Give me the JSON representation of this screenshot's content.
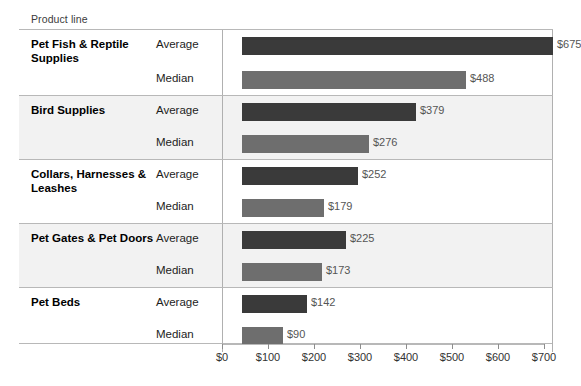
{
  "header": {
    "dimension_label": "Product line"
  },
  "chart_data": {
    "type": "bar",
    "orientation": "horizontal",
    "title": "",
    "xlabel": "",
    "ylabel": "Product line",
    "xlim": [
      0,
      700
    ],
    "grid": false,
    "legend": "none",
    "axis_ticks": [
      "$0",
      "$100",
      "$200",
      "$300",
      "$400",
      "$500",
      "$600",
      "$700"
    ],
    "axis_tick_values": [
      0,
      100,
      200,
      300,
      400,
      500,
      600,
      700
    ],
    "categories": [
      "Pet Fish & Reptile Supplies",
      "Bird Supplies",
      "Collars, Harnesses & Leashes",
      "Pet Gates & Pet Doors",
      "Pet Beds"
    ],
    "measures": [
      "Average",
      "Median"
    ],
    "series": [
      {
        "name": "Average",
        "color": "#3a3a3a",
        "values": [
          675,
          379,
          252,
          225,
          142
        ],
        "labels": [
          "$675",
          "$379",
          "$252",
          "$225",
          "$142"
        ]
      },
      {
        "name": "Median",
        "color": "#6e6e6e",
        "values": [
          488,
          276,
          179,
          173,
          90
        ],
        "labels": [
          "$488",
          "$276",
          "$179",
          "$173",
          "$90"
        ]
      }
    ],
    "rows": [
      {
        "category": "Pet Fish & Reptile Supplies",
        "banded": false,
        "cells": [
          {
            "measure": "Average",
            "value": 675,
            "label": "$675",
            "style": "average"
          },
          {
            "measure": "Median",
            "value": 488,
            "label": "$488",
            "style": "median"
          }
        ]
      },
      {
        "category": "Bird Supplies",
        "banded": true,
        "cells": [
          {
            "measure": "Average",
            "value": 379,
            "label": "$379",
            "style": "average"
          },
          {
            "measure": "Median",
            "value": 276,
            "label": "$276",
            "style": "median"
          }
        ]
      },
      {
        "category": "Collars, Harnesses & Leashes",
        "banded": false,
        "cells": [
          {
            "measure": "Average",
            "value": 252,
            "label": "$252",
            "style": "average"
          },
          {
            "measure": "Median",
            "value": 179,
            "label": "$179",
            "style": "median"
          }
        ]
      },
      {
        "category": "Pet Gates & Pet Doors",
        "banded": true,
        "cells": [
          {
            "measure": "Average",
            "value": 225,
            "label": "$225",
            "style": "average"
          },
          {
            "measure": "Median",
            "value": 173,
            "label": "$173",
            "style": "median"
          }
        ]
      },
      {
        "category": "Pet Beds",
        "banded": false,
        "cells": [
          {
            "measure": "Average",
            "value": 142,
            "label": "$142",
            "style": "average"
          },
          {
            "measure": "Median",
            "value": 90,
            "label": "$90",
            "style": "median"
          }
        ]
      }
    ]
  },
  "colors": {
    "average_bar": "#3a3a3a",
    "median_bar": "#6e6e6e",
    "band": "#f2f2f2",
    "rule": "#b8b8b8",
    "background": "#ffffff"
  }
}
